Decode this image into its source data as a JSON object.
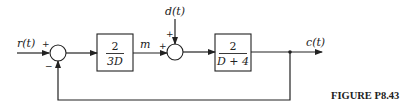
{
  "diagram": {
    "type": "block-diagram",
    "input": {
      "label": "r(t)"
    },
    "disturbance": {
      "label": "d(t)"
    },
    "output": {
      "label": "c(t)"
    },
    "summing_junction_1": {
      "plus_sign": "+",
      "minus_sign": "−"
    },
    "summing_junction_2": {
      "plus_left": "+",
      "plus_top": "+"
    },
    "block_1": {
      "numerator": "2",
      "denominator": "3D"
    },
    "signal_m": {
      "label": "m"
    },
    "block_2": {
      "numerator": "2",
      "denominator": "D + 4"
    },
    "feedback": {
      "type": "unity",
      "sign": "negative"
    },
    "caption": "FIGURE  P8.43"
  },
  "colors": {
    "stroke": "#222222",
    "background": "#ffffff"
  }
}
